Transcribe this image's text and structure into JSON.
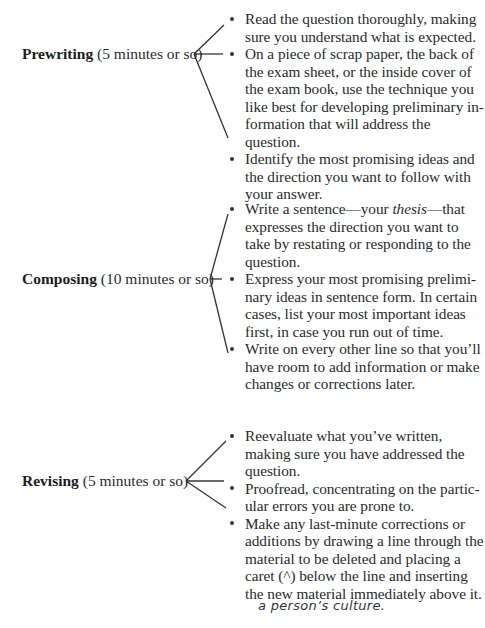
{
  "sections": [
    {
      "name": "Prewriting",
      "time": "(5 minutes or so)",
      "items": [
        "Read the question thoroughly, making sure you understand what is expected.",
        "On a piece of scrap paper, the back of the exam sheet, or the inside cover of the exam book, use the technique you like best for developing preliminary in­formation that will address the question.",
        "Identify the most promising ideas and the direction you want to follow with your answer."
      ]
    },
    {
      "name": "Composing",
      "time": "(10 minutes or so)",
      "items": [
        "Write a sentence—your thesis—that expresses the direction you want to take by restating or responding to the question.",
        "Express your most promising prelimi­nary ideas in sentence form. In certain cases, list your most important ideas first, in case you run out of time.",
        "Write on every other line so that you’ll have room to add information or make changes or corrections later."
      ]
    },
    {
      "name": "Revising",
      "time": "(5 minutes or so)",
      "items": [
        "Reevaluate what you’ve written, making sure you have addressed the question.",
        "Proofread, concentrating on the partic­ular errors you are prone to.",
        "Make any last-minute corrections or additions by drawing a line through the material to be deleted and placing a caret (^) below the line and insert­ing the new material immediately above it."
      ]
    }
  ],
  "handwritten_note": "a person’s culture."
}
